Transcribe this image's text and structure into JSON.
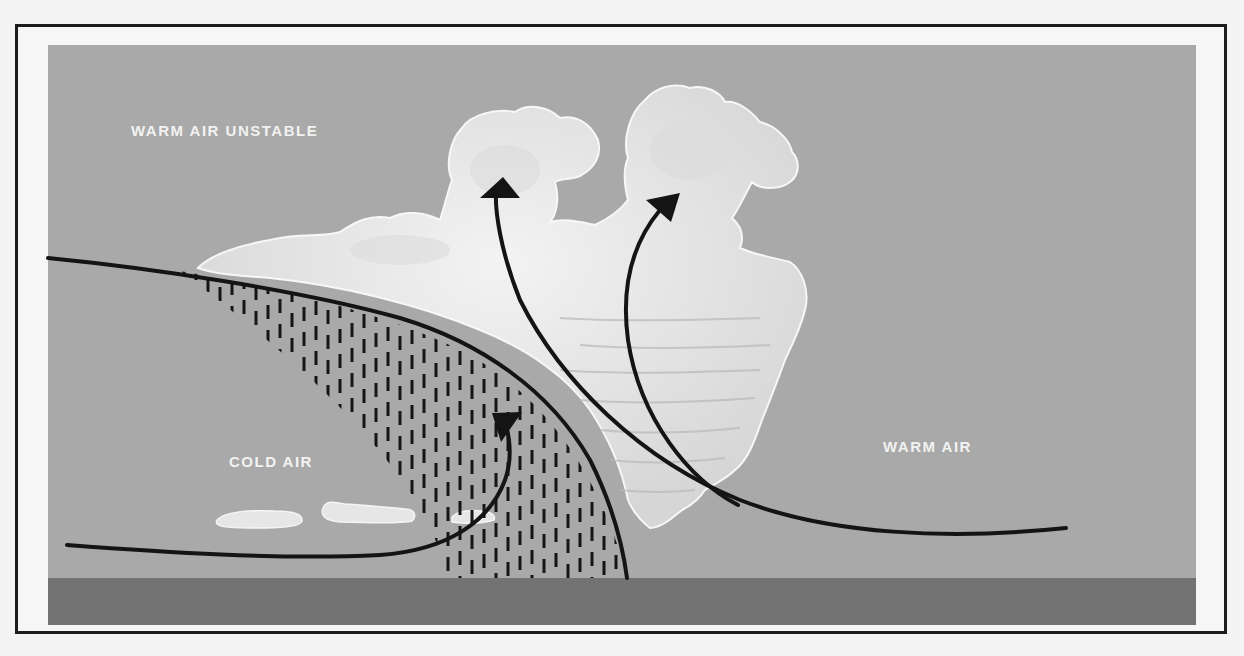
{
  "diagram": {
    "labels": {
      "warm_unstable": "WARM AIR UNSTABLE",
      "cold_air": "COLD AIR",
      "warm_air": "WARM AIR"
    },
    "colors": {
      "sky": "#a9a9a9",
      "ground": "#737373",
      "cloud": "#e8e8e8",
      "cloud_shadow": "#cfcfcf",
      "line": "#141414",
      "text": "#f2f2f2",
      "frame": "#1c1c1c"
    },
    "elements": {
      "front_boundary": "frontal surface curve",
      "rain_area": "precipitation hatching beneath front",
      "cumulonimbus": "towering cumulus cloud mass",
      "arrows": [
        "cold air wedge flow",
        "warm air rising (left tower)",
        "warm air rising (right tower)"
      ],
      "low_clouds": 3
    }
  }
}
